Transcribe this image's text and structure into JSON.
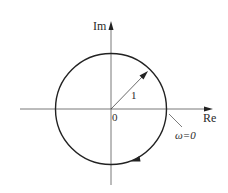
{
  "figure": {
    "type": "nyquist-plot",
    "axes": {
      "x_label": "Re",
      "y_label": "Im",
      "origin_label": "0"
    },
    "circle": {
      "radius_label": "1",
      "center": [
        0,
        0
      ],
      "radius": 1,
      "direction": "clockwise"
    },
    "annotations": {
      "start_point_label": "ω=0"
    },
    "colors": {
      "stroke": "#222222",
      "background": "#ffffff"
    }
  }
}
